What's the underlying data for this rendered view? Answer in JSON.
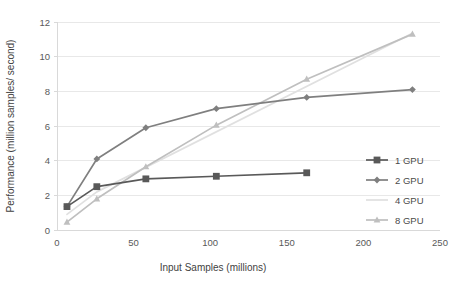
{
  "chart_data": {
    "type": "line",
    "title": "",
    "subtitle": "",
    "xlabel": "Input Samples (millions)",
    "ylabel": "Performance (million samples/ second)",
    "xlim": [
      0,
      250
    ],
    "ylim": [
      0,
      12
    ],
    "xticks": [
      0,
      50,
      100,
      150,
      200,
      250
    ],
    "yticks": [
      0,
      2,
      4,
      6,
      8,
      10,
      12
    ],
    "xtick_labels": [
      "0",
      "50",
      "100",
      "150",
      "200",
      "250"
    ],
    "ytick_labels": [
      "0",
      "2",
      "4",
      "6",
      "8",
      "10",
      "12"
    ],
    "grid": "horizontal",
    "legend_position": "right",
    "series": [
      {
        "name": "1 GPU",
        "color": "#595959",
        "marker": "square",
        "x": [
          6.5,
          26,
          58,
          104,
          163
        ],
        "values": [
          1.35,
          2.5,
          2.95,
          3.1,
          3.3
        ]
      },
      {
        "name": "2 GPU",
        "color": "#7f7f7f",
        "marker": "diamond",
        "x": [
          6.5,
          26,
          58,
          104,
          163,
          232
        ],
        "values": [
          1.35,
          4.1,
          5.9,
          7.0,
          7.65,
          8.1
        ]
      },
      {
        "name": "4 GPU",
        "color": "#e0e0e0",
        "marker": "none",
        "x": [
          6.5,
          26,
          232
        ],
        "values": [
          0.9,
          2.2,
          11.35
        ]
      },
      {
        "name": "8 GPU",
        "color": "#bfbfbf",
        "marker": "triangle",
        "x": [
          6.5,
          26,
          58,
          104,
          163,
          232
        ],
        "values": [
          0.45,
          1.8,
          3.65,
          6.05,
          8.7,
          11.3
        ]
      }
    ]
  },
  "legend": {
    "items": [
      {
        "label": "1 GPU"
      },
      {
        "label": "2 GPU"
      },
      {
        "label": "4 GPU"
      },
      {
        "label": "8 GPU"
      }
    ]
  },
  "colors": {
    "background": "#ffffff",
    "grid": "#e8e8e8",
    "axis": "#d9d9d9",
    "text": "#595959"
  }
}
